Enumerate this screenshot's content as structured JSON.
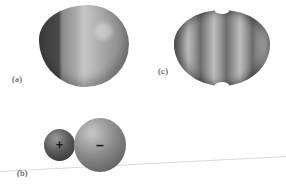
{
  "figure": {
    "panels": [
      {
        "id": "a",
        "label": "(a)",
        "description": "asymmetric shaded electron density surface"
      },
      {
        "id": "b",
        "label": "(b)",
        "description": "two spheres showing charge separation",
        "spheres": [
          {
            "size": "small",
            "charge_symbol": "+"
          },
          {
            "size": "large",
            "charge_symbol": "–"
          }
        ]
      },
      {
        "id": "c",
        "label": "(c)",
        "description": "symmetric banded electron density surface"
      }
    ]
  }
}
